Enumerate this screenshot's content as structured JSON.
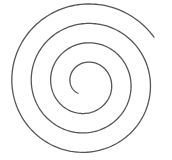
{
  "figure": {
    "type": "archimedean-spiral",
    "background": "#ffffff",
    "stroke_color": "#555555",
    "stroke_width": 1.3,
    "center": [
      86,
      83
    ],
    "start_radius": 13,
    "end_radius": 82,
    "start_angle_deg": 128,
    "turns": 3.55,
    "direction": "clockwise"
  }
}
